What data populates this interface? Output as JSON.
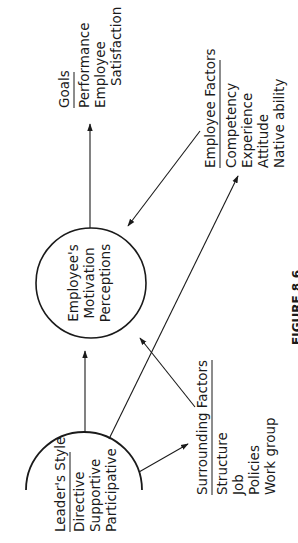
{
  "figure": {
    "caption": "FIGURE 8.6",
    "orientation": "rotated 90° counter-clockwise",
    "center_node": {
      "lines": [
        "Employee's",
        "Motivation",
        "Perceptions"
      ]
    },
    "leader_style": {
      "heading": "Leader's Style",
      "items": [
        "Directive",
        "Supportive",
        "Participative"
      ]
    },
    "surrounding_factors": {
      "heading": "Surrounding Factors",
      "items": [
        "Structure",
        "Job",
        "Policies",
        "Work group"
      ]
    },
    "employee_factors": {
      "heading": "Employee Factors",
      "items": [
        "Competency",
        "Experience",
        "Attitude",
        "Native ability"
      ]
    },
    "goals": {
      "heading": "Goals",
      "items": [
        "Performance",
        "Employee",
        "Satisfaction"
      ]
    },
    "edges": [
      {
        "from": "leader_style",
        "to": "center_node"
      },
      {
        "from": "center_node",
        "to": "goals"
      },
      {
        "from": "employee_factors",
        "to": "center_node"
      },
      {
        "from": "leader_style",
        "to": "employee_factors"
      },
      {
        "from": "surrounding_factors",
        "to": "center_node"
      },
      {
        "from": "leader_style",
        "to": "surrounding_factors"
      }
    ]
  }
}
